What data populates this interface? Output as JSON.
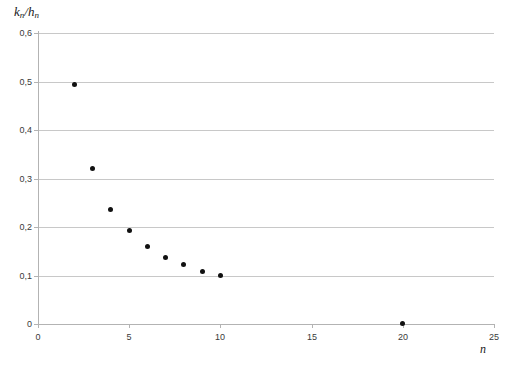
{
  "chart_data": {
    "type": "scatter",
    "title": "",
    "xlabel": "n",
    "ylabel": "k_n/h_n",
    "ylabel_parts": {
      "num": "k",
      "num_sub": "n",
      "sep": "/",
      "den": "h",
      "den_sub": "n"
    },
    "xlabel_parts": {
      "main": "n"
    },
    "x": [
      2,
      3,
      4,
      5,
      6,
      7,
      8,
      9,
      10,
      20
    ],
    "values": [
      0.494,
      0.321,
      0.237,
      0.192,
      0.16,
      0.138,
      0.123,
      0.108,
      0.099,
      0.002
    ],
    "points": [
      {
        "n": 2,
        "ratio": 0.494
      },
      {
        "n": 3,
        "ratio": 0.321
      },
      {
        "n": 4,
        "ratio": 0.237
      },
      {
        "n": 5,
        "ratio": 0.192
      },
      {
        "n": 6,
        "ratio": 0.16
      },
      {
        "n": 7,
        "ratio": 0.138
      },
      {
        "n": 8,
        "ratio": 0.123
      },
      {
        "n": 9,
        "ratio": 0.108
      },
      {
        "n": 10,
        "ratio": 0.099
      },
      {
        "n": 20,
        "ratio": 0.002
      }
    ],
    "xlim": [
      0,
      25
    ],
    "ylim": [
      0,
      0.6
    ],
    "xticks": [
      0,
      5,
      10,
      15,
      20,
      25
    ],
    "xtick_labels": [
      "0",
      "5",
      "10",
      "15",
      "20",
      "25"
    ],
    "yticks": [
      0,
      0.1,
      0.2,
      0.3,
      0.4,
      0.5,
      0.6
    ],
    "ytick_labels": [
      "0",
      "0,1",
      "0,2",
      "0,3",
      "0,4",
      "0,5",
      "0,6"
    ],
    "grid": "horizontal",
    "legend": null,
    "marker_color": "#111111",
    "grid_color": "#c8c8c8",
    "axis_color": "#b3b3b3",
    "background": "#ffffff"
  }
}
